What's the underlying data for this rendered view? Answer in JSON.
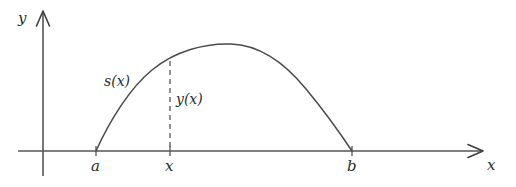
{
  "figure": {
    "title": "",
    "background_color": "#ffffff",
    "stroke_color": "#4a4a4a",
    "text_color": "#2b2b2b"
  },
  "axes": {
    "y_axis_label": "y",
    "x_axis_label": "x",
    "y_axis": {
      "x": 43,
      "top": 13,
      "bottom": 176,
      "arrow": "up"
    },
    "x_axis": {
      "y": 151,
      "left": 18,
      "right": 481,
      "arrow": "right"
    }
  },
  "ticks": [
    {
      "name": "tick-a",
      "label": "a",
      "x": 96,
      "label_x": 91,
      "label_y": 159
    },
    {
      "name": "tick-x",
      "label": "x",
      "x": 170,
      "label_x": 165,
      "label_y": 159
    },
    {
      "name": "tick-b",
      "label": "b",
      "x": 352,
      "label_x": 347,
      "label_y": 159
    }
  ],
  "annotations": [
    {
      "name": "arc-length-label",
      "label": "s(x)",
      "x": 104,
      "y": 74
    },
    {
      "name": "height-label",
      "label": "y(x)",
      "x": 176,
      "y": 92
    }
  ],
  "chart_data": {
    "type": "line",
    "title": "",
    "xlabel": "x",
    "ylabel": "y",
    "grid": false,
    "legend": "none",
    "xlim": [
      43,
      481
    ],
    "ylim": [
      151,
      13
    ],
    "curve": {
      "name": "y(x)",
      "start": {
        "x": 96,
        "y": 151
      },
      "peak": {
        "x": 231,
        "y": 44
      },
      "end": {
        "x": 352,
        "y": 151
      },
      "path": "M 96 151 C 110 120, 130 88, 152 70 C 175 51, 205 43, 231 44 C 259 45, 284 62, 306 89 C 326 113, 342 136, 352 151"
    },
    "dashed_drop": {
      "name": "y(x) ordinate",
      "x": 170,
      "y_top": 61,
      "y_bottom": 151
    },
    "points": [
      {
        "label": "a",
        "x": 96,
        "y": 151
      },
      {
        "label": "x",
        "x": 170,
        "y": 61
      },
      {
        "label": "b",
        "x": 352,
        "y": 151
      }
    ]
  }
}
